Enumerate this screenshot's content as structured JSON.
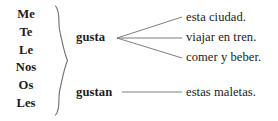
{
  "diagram": {
    "type": "grammar-diagram",
    "language": "Spanish",
    "topic": "gustar conjugation with indirect object pronouns",
    "text_color": "#1c1c1c",
    "line_color": "#6e6e6e",
    "background": "#ffffff",
    "pronouns": [
      {
        "label": "Me"
      },
      {
        "label": "Te"
      },
      {
        "label": "Le"
      },
      {
        "label": "Nos"
      },
      {
        "label": "Os"
      },
      {
        "label": "Les"
      }
    ],
    "verbs": [
      {
        "label": "gusta"
      },
      {
        "label": "gustan"
      }
    ],
    "singular_complements": [
      {
        "label": "esta ciudad."
      },
      {
        "label": "viajar en tren."
      },
      {
        "label": "comer y beber."
      }
    ],
    "plural_complements": [
      {
        "label": "estas maletas."
      }
    ]
  }
}
